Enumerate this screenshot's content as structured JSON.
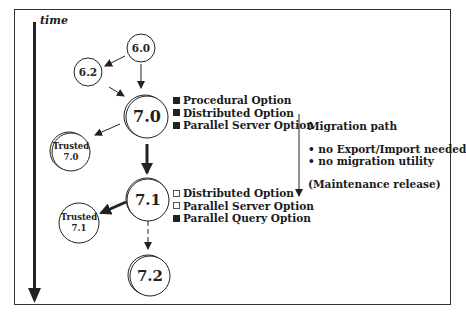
{
  "axis": {
    "label": "time"
  },
  "nodes": {
    "v60": {
      "label": "6.0"
    },
    "v62": {
      "label": "6.2"
    },
    "v70": {
      "label": "7.0"
    },
    "trusted70": {
      "line1": "Trusted",
      "line2": "7.0"
    },
    "v71": {
      "label": "7.1"
    },
    "trusted71": {
      "line1": "Trusted",
      "line2": "7.1"
    },
    "v72": {
      "label": "7.2"
    }
  },
  "options_70": [
    {
      "label": "Procedural Option",
      "state": "filled"
    },
    {
      "label": "Distributed Option",
      "state": "filled"
    },
    {
      "label": "Parallel Server Option",
      "state": "filled"
    }
  ],
  "options_71": [
    {
      "label": "Distributed Option",
      "state": "empty"
    },
    {
      "label": "Parallel Server Option",
      "state": "empty"
    },
    {
      "label": "Parallel Query Option",
      "state": "filled"
    }
  ],
  "migration": {
    "title": "Migration  path",
    "bullets": [
      "• no Export/Import needed",
      "• no migration utility"
    ],
    "note": "(Maintenance  release)"
  },
  "colors": {
    "ink": "#222222",
    "frame": "#333333",
    "background": "#ffffff"
  }
}
